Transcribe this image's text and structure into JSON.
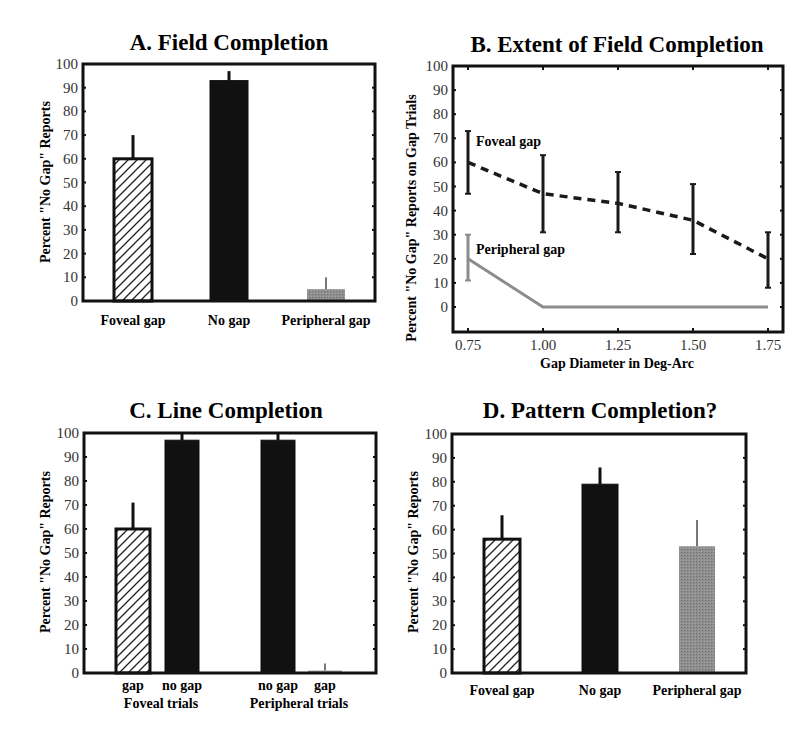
{
  "figure": {
    "panels": [
      "A",
      "B",
      "C",
      "D"
    ]
  },
  "colors": {
    "axis": "#111111",
    "black_bar": "#111111",
    "gray_bar": "#8a8a8a",
    "hatch": "#222222",
    "foveal_line": "#1a1a1a",
    "peripheral_line": "#8c8c8c"
  },
  "chart_data": [
    {
      "id": "A",
      "type": "bar",
      "title": "A. Field Completion",
      "xlabel": "",
      "ylabel": "Percent \"No Gap\" Reports",
      "ylim": [
        0,
        100
      ],
      "yticks": [
        0,
        10,
        20,
        30,
        40,
        50,
        60,
        70,
        80,
        90,
        100
      ],
      "categories": [
        "Foveal gap",
        "No gap",
        "Peripheral gap"
      ],
      "values": [
        60,
        93,
        5
      ],
      "error_upper": [
        70,
        97,
        10
      ],
      "styles": [
        "hatched",
        "black",
        "gray"
      ],
      "grid": false,
      "legend": null
    },
    {
      "id": "B",
      "type": "line",
      "title": "B. Extent of Field Completion",
      "xlabel": "Gap Diameter in Deg-Arc",
      "ylabel": "Percent \"No Gap\" Reports on Gap Trials",
      "x": [
        0.75,
        1.0,
        1.25,
        1.5,
        1.75
      ],
      "xticks": [
        "0.75",
        "1.00",
        "1.25",
        "1.50",
        "1.75"
      ],
      "ylim": [
        -10,
        100
      ],
      "yticks": [
        0,
        10,
        20,
        30,
        40,
        50,
        60,
        70,
        80,
        90,
        100
      ],
      "series": [
        {
          "name": "Foveal gap",
          "style": "dashed-black",
          "values": [
            60,
            47,
            43,
            36,
            20
          ],
          "error_low": [
            47,
            31,
            31,
            22,
            8
          ],
          "error_high": [
            73,
            63,
            56,
            51,
            31
          ]
        },
        {
          "name": "Peripheral gap",
          "style": "solid-gray",
          "values": [
            20,
            0,
            0,
            0,
            0
          ],
          "error_low": [
            11,
            null,
            null,
            null,
            null
          ],
          "error_high": [
            30,
            null,
            null,
            null,
            null
          ]
        }
      ],
      "annotations": [
        {
          "text": "Foveal gap",
          "x": 0.78,
          "y": 67
        },
        {
          "text": "Peripheral gap",
          "x": 0.78,
          "y": 22
        }
      ],
      "grid": false
    },
    {
      "id": "C",
      "type": "bar",
      "title": "C. Line Completion",
      "xlabel": "",
      "ylabel": "Percent \"No Gap\" Reports",
      "ylim": [
        0,
        100
      ],
      "yticks": [
        0,
        10,
        20,
        30,
        40,
        50,
        60,
        70,
        80,
        90,
        100
      ],
      "categories": [
        "gap",
        "no gap",
        "no gap",
        "gap"
      ],
      "groups": [
        "Foveal trials",
        "Peripheral trials"
      ],
      "values": [
        60,
        97,
        97,
        1
      ],
      "error_upper": [
        71,
        100,
        100,
        4
      ],
      "styles": [
        "hatched",
        "black",
        "black",
        "gray"
      ],
      "grid": false,
      "legend": null
    },
    {
      "id": "D",
      "type": "bar",
      "title": "D. Pattern Completion?",
      "xlabel": "",
      "ylabel": "Percent \"No Gap\" Reports",
      "ylim": [
        0,
        100
      ],
      "yticks": [
        0,
        10,
        20,
        30,
        40,
        50,
        60,
        70,
        80,
        90,
        100
      ],
      "categories": [
        "Foveal gap",
        "No gap",
        "Peripheral gap"
      ],
      "values": [
        56,
        79,
        53
      ],
      "error_upper": [
        66,
        86,
        64
      ],
      "styles": [
        "hatched",
        "black",
        "gray"
      ],
      "grid": false,
      "legend": null
    }
  ]
}
